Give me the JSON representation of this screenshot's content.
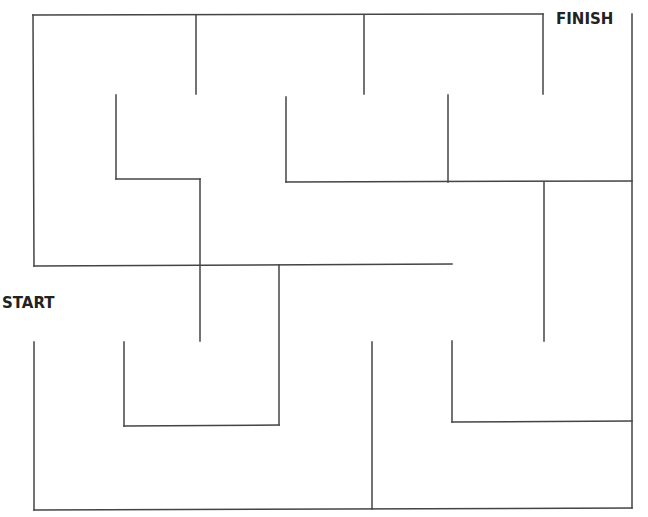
{
  "labels": {
    "start": "START",
    "finish": "FINISH"
  },
  "maze": {
    "stroke_color": "#444444",
    "stroke_width": 1.5,
    "segments": [
      [
        33,
        15,
        543,
        14
      ],
      [
        33,
        15,
        34,
        266
      ],
      [
        196,
        15,
        196,
        94
      ],
      [
        364,
        15,
        364,
        94
      ],
      [
        543,
        14,
        543,
        94
      ],
      [
        632,
        14,
        632,
        508
      ],
      [
        116,
        95,
        116,
        179
      ],
      [
        116,
        179,
        200,
        179
      ],
      [
        200,
        179,
        200,
        341
      ],
      [
        286,
        97,
        286,
        182
      ],
      [
        286,
        182,
        632,
        181
      ],
      [
        448,
        95,
        448,
        182
      ],
      [
        544,
        182,
        544,
        341
      ],
      [
        34,
        266,
        452,
        264
      ],
      [
        279,
        265,
        279,
        425
      ],
      [
        124,
        342,
        124,
        426
      ],
      [
        124,
        426,
        279,
        425
      ],
      [
        34,
        342,
        34,
        510
      ],
      [
        34,
        510,
        632,
        508
      ],
      [
        372,
        342,
        372,
        509
      ],
      [
        452,
        341,
        452,
        422
      ],
      [
        452,
        422,
        632,
        421
      ]
    ]
  }
}
